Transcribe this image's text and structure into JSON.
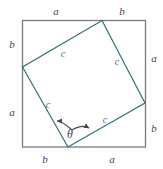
{
  "figure": {
    "colors": {
      "outer_square_stroke": "#7a7a80",
      "inner_square_stroke": "#2f6f77",
      "label_outer": "#46464a",
      "label_inner": "#2f6f77",
      "background": "#ffffff",
      "arrow": "#46464a"
    },
    "outer_square": {
      "name": "outer-square",
      "corners": {
        "top_left": [
          22,
          20
        ],
        "top_right": [
          145,
          20
        ],
        "bottom_right": [
          145,
          147
        ],
        "bottom_left": [
          22,
          147
        ]
      }
    },
    "inner_square": {
      "name": "inner-square",
      "vertices": {
        "top": [
          102,
          20
        ],
        "right": [
          145,
          103
        ],
        "bottom": [
          68,
          147
        ],
        "left": [
          22,
          67
        ]
      }
    },
    "angle_arc": {
      "label": "θ",
      "label_pos": [
        70,
        134
      ],
      "double_headed": true
    },
    "labels": {
      "top_left_segment": "a",
      "top_right_segment": "b",
      "right_upper_segment": "a",
      "right_lower_segment": "b",
      "bottom_left_segment": "b",
      "bottom_right_segment": "a",
      "left_upper_segment": "b",
      "left_lower_segment": "a",
      "hyp_top_left": "c",
      "hyp_top_right": "c",
      "hyp_bottom_left": "c",
      "hyp_bottom_right": "c"
    }
  }
}
